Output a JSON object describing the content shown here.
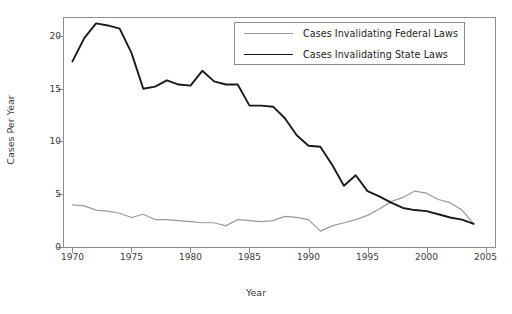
{
  "chart_data": {
    "type": "line",
    "title": "",
    "xlabel": "Year",
    "ylabel": "Cases Per Year",
    "xlim": [
      1969.2,
      2005.8
    ],
    "ylim": [
      0,
      21.8
    ],
    "xticks": [
      1970,
      1975,
      1980,
      1985,
      1990,
      1995,
      2000,
      2005
    ],
    "xticklabels": [
      "1970",
      "1975",
      "1980",
      "1985",
      "1990",
      "1995",
      "2000",
      "2005"
    ],
    "yticks": [
      0,
      5,
      10,
      15,
      20
    ],
    "yticklabels": [
      "0",
      "5",
      "10",
      "15",
      "20"
    ],
    "grid": false,
    "legend_position": "top-right",
    "x": [
      1970,
      1971,
      1972,
      1973,
      1974,
      1975,
      1976,
      1977,
      1978,
      1979,
      1980,
      1981,
      1982,
      1983,
      1984,
      1985,
      1986,
      1987,
      1988,
      1989,
      1990,
      1991,
      1992,
      1993,
      1994,
      1995,
      1996,
      1997,
      1998,
      1999,
      2000,
      2001,
      2002,
      2003,
      2004
    ],
    "series": [
      {
        "name": "Cases Invalidating Federal Laws",
        "color": "#9a9a9a",
        "values": [
          4.0,
          3.9,
          3.5,
          3.4,
          3.2,
          2.8,
          3.1,
          2.6,
          2.6,
          2.5,
          2.4,
          2.3,
          2.3,
          2.0,
          2.6,
          2.5,
          2.4,
          2.5,
          2.9,
          2.8,
          2.6,
          1.5,
          2.0,
          2.3,
          2.6,
          3.0,
          3.6,
          4.3,
          4.7,
          5.3,
          5.1,
          4.5,
          4.2,
          3.5,
          2.2
        ]
      },
      {
        "name": "Cases Invalidating State Laws",
        "color": "#1a1a1a",
        "values": [
          17.6,
          19.8,
          21.2,
          21.0,
          20.7,
          18.4,
          15.0,
          15.2,
          15.8,
          15.4,
          15.3,
          16.7,
          15.7,
          15.4,
          15.4,
          13.4,
          13.4,
          13.3,
          12.2,
          10.6,
          9.6,
          9.5,
          7.8,
          5.8,
          6.8,
          5.3,
          4.8,
          4.2,
          3.7,
          3.5,
          3.4,
          3.1,
          2.8,
          2.6,
          2.2
        ]
      }
    ]
  },
  "legend": {
    "items": [
      {
        "label": "Cases Invalidating Federal Laws"
      },
      {
        "label": "Cases Invalidating State Laws"
      }
    ]
  }
}
